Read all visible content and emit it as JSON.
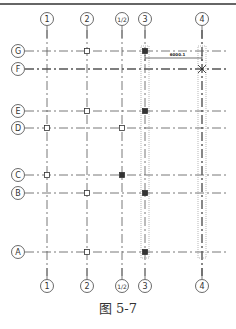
{
  "figure": {
    "caption": "图 5-7",
    "top_rule_label": "—"
  },
  "columns": [
    {
      "id": "1",
      "label": "1",
      "x": 47
    },
    {
      "id": "2",
      "label": "2",
      "x": 87
    },
    {
      "id": "1/2",
      "label": "1/2",
      "x": 122
    },
    {
      "id": "3",
      "label": "3",
      "x": 145
    },
    {
      "id": "4",
      "label": "4",
      "x": 202
    }
  ],
  "rows": [
    {
      "id": "G",
      "label": "G",
      "y": 51
    },
    {
      "id": "F",
      "label": "F",
      "y": 69
    },
    {
      "id": "E",
      "label": "E",
      "y": 111
    },
    {
      "id": "D",
      "label": "D",
      "y": 128
    },
    {
      "id": "C",
      "label": "C",
      "y": 175
    },
    {
      "id": "B",
      "label": "B",
      "y": 193
    },
    {
      "id": "A",
      "label": "A",
      "y": 252
    }
  ],
  "column_markers": [
    {
      "col": "2",
      "row": "G",
      "filled": false
    },
    {
      "col": "3",
      "row": "G",
      "filled": true
    },
    {
      "col": "2",
      "row": "E",
      "filled": false
    },
    {
      "col": "3",
      "row": "E",
      "filled": true
    },
    {
      "col": "1",
      "row": "D",
      "filled": false
    },
    {
      "col": "1/2",
      "row": "D",
      "filled": false
    },
    {
      "col": "1",
      "row": "C",
      "filled": false
    },
    {
      "col": "1/2",
      "row": "C",
      "filled": true
    },
    {
      "col": "2",
      "row": "B",
      "filled": false
    },
    {
      "col": "3",
      "row": "B",
      "filled": true
    },
    {
      "col": "2",
      "row": "A",
      "filled": false
    },
    {
      "col": "3",
      "row": "A",
      "filled": true
    }
  ],
  "dimension": {
    "label": "6000.1",
    "from_col": "3",
    "to_col": "4",
    "y": 58
  },
  "crosshair": {
    "col": "4",
    "row": "F"
  },
  "colors": {
    "line": "#444444",
    "grid": "#555555",
    "highlight": "#888888",
    "marker_filled": "#333333"
  }
}
